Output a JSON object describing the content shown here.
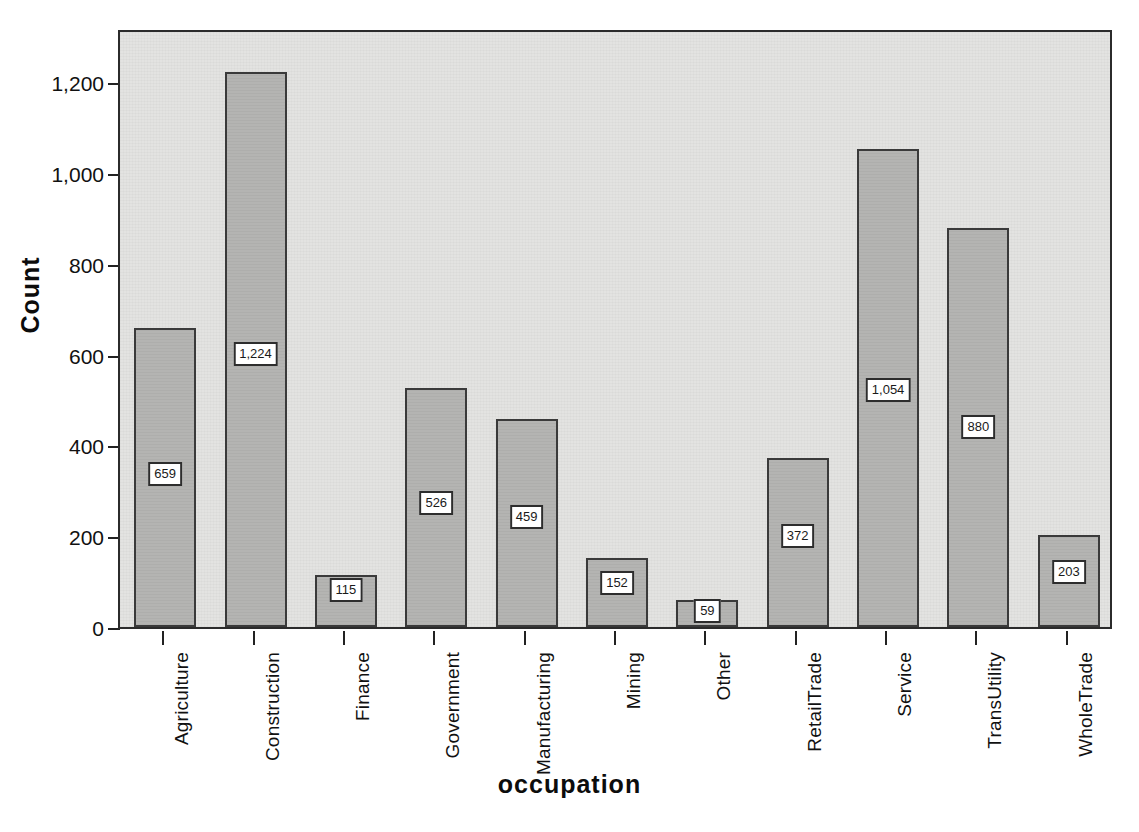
{
  "chart_data": {
    "type": "bar",
    "title": "",
    "xlabel": "occupation",
    "ylabel": "Count",
    "categories": [
      "Agriculture",
      "Construction",
      "Finance",
      "Government",
      "Manufacturing",
      "Mining",
      "Other",
      "RetailTrade",
      "Service",
      "TransUtility",
      "WholeTrade"
    ],
    "values": [
      659,
      1224,
      115,
      526,
      459,
      152,
      59,
      372,
      1054,
      880,
      203
    ],
    "value_labels": [
      "659",
      "1,224",
      "115",
      "526",
      "459",
      "152",
      "59",
      "372",
      "1,054",
      "880",
      "203"
    ],
    "ylim": [
      0,
      1320
    ],
    "yticks": [
      0,
      200,
      400,
      600,
      800,
      1000,
      1200
    ],
    "ytick_labels": [
      "0",
      "200",
      "400",
      "600",
      "800",
      "1,000",
      "1,200"
    ],
    "grid": false,
    "legend": "none",
    "bar_color": "#b4b4b2",
    "bar_edge_color": "#3a3a3a",
    "plot_background": "#e3e3e1",
    "label_box_background": "#ffffff",
    "label_box_border": "#2d2d2d"
  },
  "background_bleed": {
    "lines": [
      "accompanying notes form part of these statements",
      "reported figures have been adjusted for the period under review",
      "totals may not sum exactly owing to rounding of the counts",
      "source data collected from the regional survey sample"
    ]
  }
}
